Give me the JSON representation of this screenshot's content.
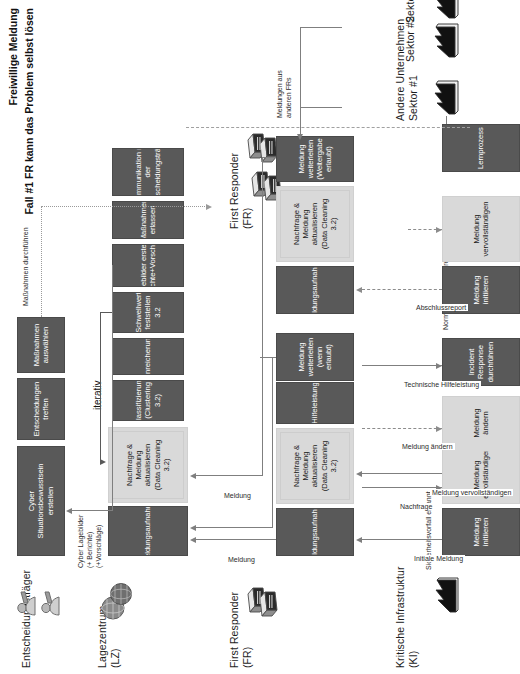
{
  "diagram": {
    "title_line1": "Freiwillige Meldung",
    "title_line2": "Fall #1 FR kann das Problem selbst lösen"
  },
  "lanes": [
    {
      "id": "entscheidungstraeger",
      "label": "Entscheidungsträger"
    },
    {
      "id": "lagezentrum",
      "label": "Lagezentrum\n(LZ)"
    },
    {
      "id": "first_responder",
      "label": "First Responder\n(FR)"
    },
    {
      "id": "kritische_infrastruktur",
      "label": "Kritische Infrastruktur\n(KI)"
    },
    {
      "id": "first_responder_2",
      "label": "First Responder\n(FR)"
    },
    {
      "id": "andere_unternehmen",
      "label": "Andere Unternehmen\nSektor #1"
    }
  ],
  "lane_labels": {
    "entscheidungstraeger": "Entscheidungsträger",
    "lagezentrum_l1": "Lagezentrum",
    "lagezentrum_l2": "(LZ)",
    "first_responder_l1": "First Responder",
    "first_responder_l2": "(FR)",
    "ki_l1": "Kritische Infrastruktur",
    "ki_l2": "(KI)",
    "fr2_l1": "First Responder",
    "fr2_l2": "(FR)",
    "sektor1_l1": "Andere Unternehmen",
    "sektor1_l2": "Sektor #1",
    "sektor2": "Sektor #2",
    "sektor3": "Sektor #3"
  },
  "entscheidungstraeger": {
    "tasks": [
      "Cyber\nSituationsbewusstsein\nerstellen",
      "Entscheidungen\ntreffen",
      "Maßnahmen\nauswählen"
    ],
    "t1": "Cyber Situationsbewusstsein erstellen",
    "t1a": "Cyber",
    "t1b": "Situationsbewusstsein",
    "t1c": "erstellen",
    "t2a": "Entscheidungen",
    "t2b": "treffen",
    "t3a": "Maßnahmen",
    "t3b": "auswählen"
  },
  "lagezentrum": {
    "tasks": [
      {
        "label_lines": [
          "Meldungsaufnahme"
        ],
        "style": "dark"
      },
      {
        "label_lines": [
          "Nachfrage & Meldung",
          "aktualisieren",
          "(Data Cleaning 3.2)"
        ],
        "style": "light"
      },
      {
        "label_lines": [
          "Klassifizierung",
          "(Clustering 3.2)"
        ],
        "style": "dark"
      },
      {
        "label_lines": [
          "Anreicherung"
        ],
        "style": "dark"
      },
      {
        "label_lines": [
          "Schwellwert",
          "feststellen 3.2"
        ],
        "style": "dark"
      },
      {
        "label_lines": [
          "Lagebilder erstellen",
          "(Berichte+Vorschläge)"
        ],
        "style": "dark"
      },
      {
        "label_lines": [
          "Maßnahmen erlassen"
        ],
        "style": "dark"
      },
      {
        "label_lines": [
          "Kommunikation mit",
          "der",
          "Entscheidungsträger"
        ],
        "style": "dark"
      }
    ],
    "iterativ": "iterativ"
  },
  "first_responder": {
    "tasks": [
      {
        "label_lines": [
          "Meldungsaufnahme"
        ],
        "style": "dark"
      },
      {
        "label_lines": [
          "Nachfrage & Meldung",
          "aktualisieren",
          "(Data Cleaning 3.2)"
        ],
        "style": "light"
      },
      {
        "label_lines": [
          "Hilfeleistung"
        ],
        "style": "dark"
      },
      {
        "label_lines": [
          "Meldung weiterleiten",
          "(wenn erlaubt)"
        ],
        "style": "dark"
      },
      {
        "label_lines": [
          "Meldungsaufnahme"
        ],
        "style": "dark"
      },
      {
        "label_lines": [
          "Nachfrage & Meldung",
          "aktualisieren",
          "(Data Cleaning 3.2)"
        ],
        "style": "light"
      },
      {
        "label_lines": [
          "Meldung weiterleiten",
          "(Weitergabe erlaubt)"
        ],
        "style": "dark"
      }
    ]
  },
  "kritische_infrastruktur": {
    "start_event": "Sicherheitsvorfall erkannt",
    "mid_event": "Normaler Zustand erreicht",
    "tasks": [
      {
        "label_lines": [
          "Meldung initiieren"
        ],
        "style": "dark"
      },
      {
        "label_lines": [
          "Meldung",
          "vervollständigen"
        ],
        "style": "light"
      },
      {
        "label_lines": [
          "Meldung ändern"
        ],
        "style": "light"
      },
      {
        "label_lines": [
          "Incident Response",
          "durchführen"
        ],
        "style": "dark"
      },
      {
        "label_lines": [
          "Meldung initiieren"
        ],
        "style": "dark"
      },
      {
        "label_lines": [
          "Meldung",
          "vervollständigen"
        ],
        "style": "light"
      },
      {
        "label_lines": [
          "Lernprozess"
        ],
        "style": "dark"
      }
    ]
  },
  "flows": {
    "initiale_meldung": "Initiale Meldung",
    "nachfrage": "Nachfrage",
    "meldung_vervollstaendigen": "Meldung vervollständigen",
    "meldung_aendern": "Meldung ändern",
    "technische_hilfeleistung": "Technische Hilfeleistung",
    "abschlussreport": "Abschlussreport",
    "meldung_a": "Meldung",
    "meldung_b": "Meldung",
    "cyber_lagebilder_l1": "Cyber Lagebilder",
    "cyber_lagebilder_l2": "(+ Berichte)",
    "cyber_lagebilder_l3": "(+Vorschläge)",
    "massnahmen_durchfuehren": "Maßnahmen durchführen",
    "meldungen_aus_anderen_l1": "Meldungen aus",
    "meldungen_aus_anderen_l2": "anderen FRs"
  },
  "colors": {
    "task_dark": "#595959",
    "task_light": "#d9d9d9",
    "line": "#7f7f7f",
    "text_dark": "#1a1a1a",
    "text_light": "#ffffff"
  },
  "icons": {
    "decision_maker": "person-icon",
    "operations_center": "globe-icon",
    "responder": "server-icon",
    "infrastructure": "factory-icon",
    "company": "factory-icon"
  }
}
